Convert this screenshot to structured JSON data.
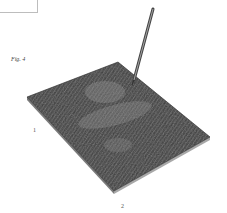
{
  "figure": {
    "label": "Fig. 4",
    "reference_numerals": [
      {
        "id": "tablet",
        "text": "1"
      },
      {
        "id": "base",
        "text": "2"
      }
    ]
  },
  "colors": {
    "surface": "#3a3a3a",
    "surface_texture": "#8a8a8a",
    "edge": "#9a9a9a",
    "stylus": "#555555"
  }
}
